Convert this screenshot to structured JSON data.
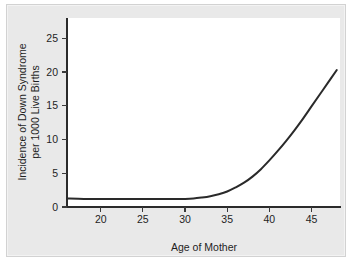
{
  "chart_data": {
    "type": "line",
    "title": "",
    "subtitle": "",
    "xlabel": "Age of Mother",
    "ylabel": "Incidence of Down Syndrome per 1000 Live Births",
    "ylabel_line1": "Incidence of Down Syndrome",
    "ylabel_line2": "per 1000 Live Births",
    "xlim": [
      16,
      48.5
    ],
    "ylim": [
      0,
      28
    ],
    "xticks": [
      20,
      25,
      30,
      35,
      40,
      45
    ],
    "yticks": [
      0,
      5,
      10,
      15,
      20,
      25
    ],
    "xtick_labels": [
      "20",
      "25",
      "30",
      "35",
      "40",
      "45"
    ],
    "ytick_labels": [
      "0",
      "5",
      "10",
      "15",
      "20",
      "25"
    ],
    "grid": false,
    "legend": false,
    "legend_position": "none",
    "series": [
      {
        "name": "Incidence of Down Syndrome per 1000 Live Births",
        "color": "#2a2a2a",
        "x": [
          16,
          18,
          20,
          22,
          24,
          26,
          28,
          30,
          31,
          32,
          33,
          34,
          35,
          36,
          37,
          38,
          39,
          40,
          41,
          42,
          43,
          44,
          45,
          46,
          47,
          48
        ],
        "values": [
          1.25,
          1.2,
          1.2,
          1.2,
          1.2,
          1.2,
          1.2,
          1.2,
          1.25,
          1.4,
          1.6,
          1.9,
          2.3,
          2.9,
          3.6,
          4.5,
          5.6,
          6.9,
          8.3,
          9.8,
          11.4,
          13.1,
          14.9,
          16.7,
          18.5,
          20.3
        ]
      }
    ]
  },
  "axes": {
    "y_title_line1": "Incidence of Down Syndrome",
    "y_title_line2": "per 1000 Live Births",
    "x_title": "Age of Mother"
  },
  "colors": {
    "panel_background": "#e9e9e9",
    "plot_background": "#ffffff",
    "axis": "#2b2b2b",
    "curve": "#2a2a2a",
    "text": "#1e1e1e"
  }
}
